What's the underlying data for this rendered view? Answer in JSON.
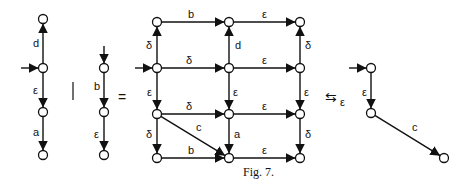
{
  "figure": {
    "caption": "Fig. 7.",
    "operators": {
      "parallel": "|",
      "equals": "=",
      "bisim": "⇆",
      "bisim_sub": "ε"
    }
  },
  "graph_left": {
    "nodes": [
      [
        43,
        19
      ],
      [
        43,
        68
      ],
      [
        43,
        112
      ],
      [
        43,
        155
      ]
    ],
    "start": 1,
    "edges": [
      {
        "from": 1,
        "to": 0,
        "label": "d",
        "lx": 33,
        "ly": 47
      },
      {
        "from": 1,
        "to": 2,
        "label": "ε",
        "lx": 33,
        "ly": 94
      },
      {
        "from": 2,
        "to": 3,
        "label": "a",
        "lx": 33,
        "ly": 136
      }
    ]
  },
  "graph_middle": {
    "nodes": [
      [
        104,
        68
      ],
      [
        104,
        112
      ],
      [
        104,
        155
      ]
    ],
    "start_top": 0,
    "edges": [
      {
        "from": 0,
        "to": 1,
        "label": "b",
        "lx": 94,
        "ly": 90
      },
      {
        "from": 1,
        "to": 2,
        "label": "ε",
        "lx": 94,
        "ly": 138
      }
    ]
  },
  "graph_product": {
    "nodes": [
      [
        157,
        22
      ],
      [
        229,
        22
      ],
      [
        300,
        22
      ],
      [
        157,
        68
      ],
      [
        229,
        68
      ],
      [
        300,
        68
      ],
      [
        157,
        114
      ],
      [
        229,
        114
      ],
      [
        300,
        114
      ],
      [
        157,
        158
      ],
      [
        229,
        158
      ],
      [
        300,
        158
      ]
    ],
    "start": 3,
    "edges": [
      {
        "from": 0,
        "to": 1,
        "label": "b",
        "lx": 188,
        "ly": 18
      },
      {
        "from": 1,
        "to": 2,
        "label": "ε",
        "lx": 262,
        "ly": 18
      },
      {
        "from": 3,
        "to": 0,
        "label": "δ",
        "lx": 146,
        "ly": 49
      },
      {
        "from": 4,
        "to": 1,
        "label": "d",
        "lx": 235,
        "ly": 49
      },
      {
        "from": 5,
        "to": 2,
        "label": "δ",
        "lx": 305,
        "ly": 49
      },
      {
        "from": 3,
        "to": 4,
        "label": "δ",
        "lx": 186,
        "ly": 64
      },
      {
        "from": 4,
        "to": 5,
        "label": "ε",
        "lx": 262,
        "ly": 64
      },
      {
        "from": 3,
        "to": 6,
        "label": "ε",
        "lx": 147,
        "ly": 96
      },
      {
        "from": 4,
        "to": 7,
        "label": "ε",
        "lx": 233,
        "ly": 96
      },
      {
        "from": 5,
        "to": 8,
        "label": "ε",
        "lx": 304,
        "ly": 96
      },
      {
        "from": 6,
        "to": 7,
        "label": "δ",
        "lx": 186,
        "ly": 110
      },
      {
        "from": 7,
        "to": 8,
        "label": "ε",
        "lx": 262,
        "ly": 110
      },
      {
        "from": 6,
        "to": 10,
        "label": "c",
        "lx": 196,
        "ly": 131
      },
      {
        "from": 6,
        "to": 9,
        "label": "δ",
        "lx": 146,
        "ly": 138
      },
      {
        "from": 7,
        "to": 10,
        "label": "a",
        "lx": 234,
        "ly": 138
      },
      {
        "from": 8,
        "to": 11,
        "label": "δ",
        "lx": 305,
        "ly": 138
      },
      {
        "from": 9,
        "to": 10,
        "label": "b",
        "lx": 188,
        "ly": 154
      },
      {
        "from": 10,
        "to": 11,
        "label": "ε",
        "lx": 262,
        "ly": 154
      }
    ]
  },
  "graph_result": {
    "nodes": [
      [
        371,
        68
      ],
      [
        371,
        113
      ],
      [
        444,
        158
      ]
    ],
    "start": 0,
    "edges": [
      {
        "from": 0,
        "to": 1,
        "label": "ε",
        "lx": 362,
        "ly": 96
      },
      {
        "from": 1,
        "to": 2,
        "label": "c",
        "lx": 412,
        "ly": 131
      }
    ]
  }
}
